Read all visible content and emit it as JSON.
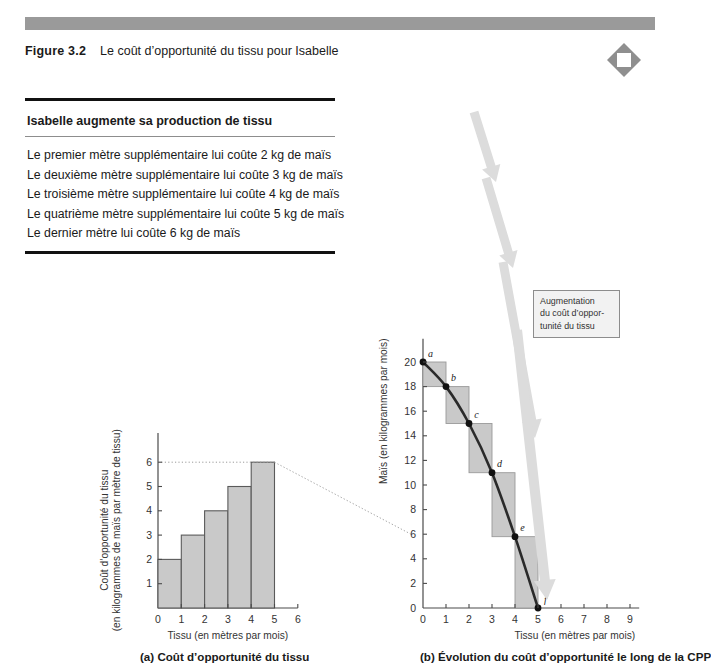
{
  "header": {
    "figure_number": "Figure 3.2",
    "figure_title": "Le coût d’opportunité du tissu pour Isabelle",
    "bar_color": "#9a9a9a",
    "logo_icon": "diamond-logo-icon"
  },
  "textbox": {
    "heading": "Isabelle augmente sa production de tissu",
    "items": [
      "Le premier mètre supplémentaire lui coûte 2 kg de maïs",
      "Le deuxième mètre supplémentaire lui coûte 3 kg de maïs",
      "Le troisième mètre supplémentaire lui coûte 4 kg de maïs",
      "Le quatrième mètre supplémentaire lui coûte 5 kg de maïs",
      "Le dernier mètre lui coûte 6 kg de maïs"
    ]
  },
  "captions": {
    "panel_a": "(a) Coût d’opportunité du tissu",
    "panel_b": "(b) Évolution du coût d’opportunité le long de la CPP"
  },
  "callout": {
    "lines": [
      "Augmentation",
      "du coût d’oppor-",
      "tunité du tissu"
    ],
    "border_color": "#8d8d8d",
    "fill_color": "#f2f2f2"
  },
  "chart_data": [
    {
      "id": "panel-a",
      "type": "bar",
      "title": "(a) Coût d’opportunité du tissu",
      "xlabel": "Tissu (en mètres par mois)",
      "ylabel": "Coût d’opportunité du tissu (en kilogrammes de maïs par mètre de tissu)",
      "ylabel_line1": "Coût d’opportunité du tissu",
      "ylabel_line2": "(en kilogrammes de maïs par mètre de tissu)",
      "xticks": [
        0,
        1,
        2,
        3,
        4,
        5,
        6
      ],
      "yticks": [
        0,
        1,
        2,
        3,
        4,
        5,
        6
      ],
      "xlim": [
        0,
        6
      ],
      "ylim": [
        0,
        7.2
      ],
      "grid": false,
      "bar_fill": "#c9c9c9",
      "bar_stroke": "#5a5a5a",
      "bars": [
        {
          "x_start": 0,
          "x_end": 1,
          "value": 2
        },
        {
          "x_start": 1,
          "x_end": 2,
          "value": 3
        },
        {
          "x_start": 2,
          "x_end": 3,
          "value": 4
        },
        {
          "x_start": 3,
          "x_end": 4,
          "value": 5
        },
        {
          "x_start": 4,
          "x_end": 5,
          "value": 6
        }
      ],
      "reference_line_y": 6
    },
    {
      "id": "panel-b",
      "type": "line",
      "title": "(b) Évolution du coût d’opportunité le long de la CPP",
      "xlabel": "Tissu (en mètres par mois)",
      "ylabel": "Maïs (en kilogrammes par mois)",
      "xticks": [
        0,
        1,
        2,
        3,
        4,
        5,
        6,
        7,
        8,
        9
      ],
      "yticks": [
        0,
        2,
        4,
        6,
        8,
        10,
        12,
        14,
        16,
        18,
        20
      ],
      "xlim": [
        0,
        9
      ],
      "ylim": [
        0,
        21.5
      ],
      "grid": false,
      "curve_color": "#2a2a2a",
      "step_fill": "#c9c9c9",
      "step_stroke": "#9a9a9a",
      "points": [
        {
          "label": "a",
          "x": 0,
          "y": 20
        },
        {
          "label": "b",
          "x": 1,
          "y": 18
        },
        {
          "label": "c",
          "x": 2,
          "y": 15
        },
        {
          "label": "d",
          "x": 3,
          "y": 11
        },
        {
          "label": "e",
          "x": 4,
          "y": 5.8
        },
        {
          "label": "f",
          "x": 5,
          "y": 0
        }
      ],
      "steps": [
        {
          "x_start": 0,
          "x_end": 1,
          "y_top": 20,
          "y_bottom": 18,
          "cost": 2
        },
        {
          "x_start": 1,
          "x_end": 2,
          "y_top": 18,
          "y_bottom": 15,
          "cost": 3
        },
        {
          "x_start": 2,
          "x_end": 3,
          "y_top": 15,
          "y_bottom": 11,
          "cost": 4
        },
        {
          "x_start": 3,
          "x_end": 4,
          "y_top": 11,
          "y_bottom": 5.8,
          "cost": 5
        },
        {
          "x_start": 4,
          "x_end": 5,
          "y_top": 5.8,
          "y_bottom": 0,
          "cost": 6
        }
      ],
      "reference_line_y": 6,
      "annotation_arrow_color": "#dcdcdc",
      "annotation_text": "Augmentation du coût d’opportunité du tissu"
    }
  ]
}
